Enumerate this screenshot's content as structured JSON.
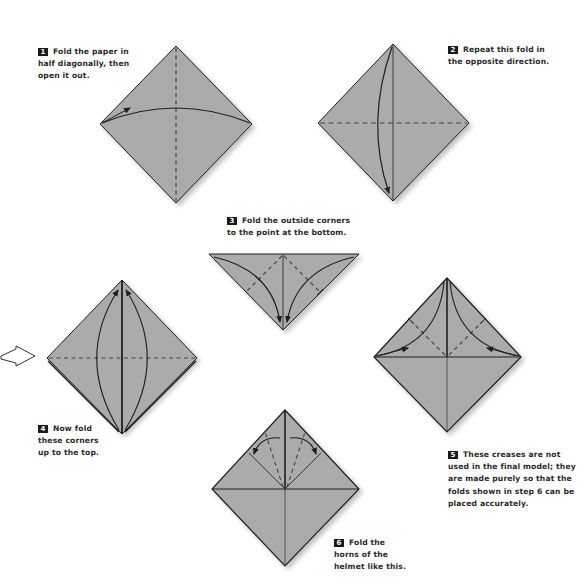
{
  "colors": {
    "paper": "#ababab",
    "line": "#1e1e1e",
    "crease": "#444444",
    "badge_bg": "#1a1a1a",
    "text": "#2a2a2a"
  },
  "steps": [
    {
      "number": "1",
      "lines": [
        "Fold the paper in",
        "half diagonally, then",
        "open it out."
      ]
    },
    {
      "number": "2",
      "lines": [
        "Repeat this fold in",
        "the opposite direction."
      ]
    },
    {
      "number": "3",
      "lines": [
        "Fold the outside corners",
        "to the point at the bottom."
      ]
    },
    {
      "number": "4",
      "lines": [
        "Now fold",
        "these corners",
        "up to the top."
      ]
    },
    {
      "number": "5",
      "lines": [
        "These creases are not",
        "used in the final model; they",
        "are made purely so that the",
        "folds shown in step 6 can be",
        "placed accurately."
      ]
    },
    {
      "number": "6",
      "lines": [
        "Fold the",
        "horns of the",
        "helmet like this."
      ]
    }
  ],
  "icons": {
    "turn_over_arrow": "outline-arrow-right"
  }
}
